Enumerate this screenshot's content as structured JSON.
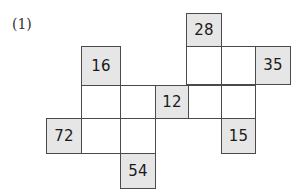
{
  "label": {
    "text": "(1)",
    "x": 12,
    "y": 17
  },
  "colors": {
    "shaded_fill": "#e6e6e6",
    "empty_fill": "#ffffff",
    "border": "#4a4a4a",
    "text": "#1a1a1a",
    "label_text": "#333333",
    "background": "#ffffff"
  },
  "grid": {
    "column_edges": [
      46,
      81,
      120,
      155,
      188,
      221,
      255,
      290
    ],
    "row_edges": [
      13,
      47,
      85,
      118,
      153,
      186
    ],
    "columns": 7,
    "rows": 5
  },
  "cells": [
    {
      "name": "cell-r1c5",
      "row": 1,
      "col": 5,
      "value": "28",
      "shaded": true,
      "x": 186,
      "y": 13,
      "w": 36,
      "h": 34
    },
    {
      "name": "cell-r2c2",
      "row": 2,
      "col": 2,
      "value": "16",
      "shaded": true,
      "x": 81,
      "y": 46,
      "w": 40,
      "h": 40
    },
    {
      "name": "cell-r2c5",
      "row": 2,
      "col": 5,
      "value": "",
      "shaded": false,
      "x": 186,
      "y": 46,
      "w": 36,
      "h": 39
    },
    {
      "name": "cell-r2c6",
      "row": 2,
      "col": 6,
      "value": "",
      "shaded": false,
      "x": 221,
      "y": 46,
      "w": 35,
      "h": 39
    },
    {
      "name": "cell-r2c7",
      "row": 2,
      "col": 7,
      "value": "35",
      "shaded": true,
      "x": 255,
      "y": 46,
      "w": 36,
      "h": 39
    },
    {
      "name": "cell-r3c2",
      "row": 3,
      "col": 2,
      "value": "",
      "shaded": false,
      "x": 81,
      "y": 85,
      "w": 40,
      "h": 34
    },
    {
      "name": "cell-r3c3",
      "row": 3,
      "col": 3,
      "value": "",
      "shaded": false,
      "x": 120,
      "y": 85,
      "w": 36,
      "h": 34
    },
    {
      "name": "cell-r3c4",
      "row": 3,
      "col": 4,
      "value": "12",
      "shaded": true,
      "x": 155,
      "y": 85,
      "w": 34,
      "h": 34
    },
    {
      "name": "cell-r3c5",
      "row": 3,
      "col": 5,
      "value": "",
      "shaded": false,
      "x": 188,
      "y": 85,
      "w": 34,
      "h": 34
    },
    {
      "name": "cell-r3c6",
      "row": 3,
      "col": 6,
      "value": "",
      "shaded": false,
      "x": 221,
      "y": 85,
      "w": 35,
      "h": 34
    },
    {
      "name": "cell-r4c1",
      "row": 4,
      "col": 1,
      "value": "72",
      "shaded": true,
      "x": 46,
      "y": 118,
      "w": 36,
      "h": 36
    },
    {
      "name": "cell-r4c2",
      "row": 4,
      "col": 2,
      "value": "",
      "shaded": false,
      "x": 81,
      "y": 118,
      "w": 40,
      "h": 36
    },
    {
      "name": "cell-r4c3",
      "row": 4,
      "col": 3,
      "value": "",
      "shaded": false,
      "x": 120,
      "y": 118,
      "w": 36,
      "h": 36
    },
    {
      "name": "cell-r4c6",
      "row": 4,
      "col": 6,
      "value": "15",
      "shaded": true,
      "x": 221,
      "y": 118,
      "w": 35,
      "h": 36
    },
    {
      "name": "cell-r5c3",
      "row": 5,
      "col": 3,
      "value": "54",
      "shaded": true,
      "x": 120,
      "y": 153,
      "w": 36,
      "h": 36
    }
  ]
}
